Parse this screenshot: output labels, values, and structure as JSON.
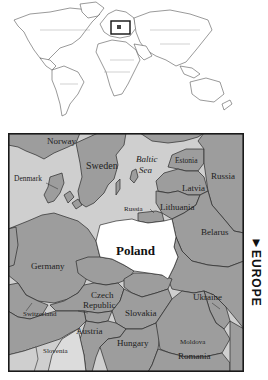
{
  "inset": {
    "description": "world map outline with locator rectangle over Europe",
    "locator_box": {
      "x": 111,
      "y": 21,
      "w": 19,
      "h": 13
    }
  },
  "map": {
    "side_label": "EUROPE",
    "side_arrow": "▼",
    "highlighted_country": "Poland",
    "colors": {
      "land": "#9d9d9d",
      "sea": "#cfcfcf",
      "highlight": "#ffffff",
      "border": "#2a2a2a",
      "frame": "#1a1a1a"
    },
    "labels": {
      "norway": "Norway",
      "sweden": "Sweden",
      "denmark": "Denmark",
      "baltic_sea_1": "Baltic",
      "baltic_sea_2": "Sea",
      "estonia": "Estonia",
      "russia_east": "Russia",
      "latvia": "Latvia",
      "lithuania": "Lithuania",
      "russia_kaliningrad": "Russia",
      "belarus": "Belarus",
      "poland": "Poland",
      "germany": "Germany",
      "czech_1": "Czech",
      "czech_2": "Republic",
      "ukraine": "Ukraine",
      "switzerland": "Switzerland",
      "slovakia": "Slovakia",
      "austria": "Austria",
      "hungary": "Hungary",
      "moldova": "Moldova",
      "slovenia": "Slovenia",
      "romania": "Romania"
    }
  }
}
